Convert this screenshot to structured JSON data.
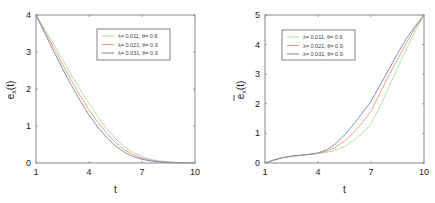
{
  "chart_data": [
    {
      "type": "line",
      "title": "",
      "xlabel": "t",
      "ylabel": "e_x(t)",
      "ylabel_main": "e",
      "ylabel_sub": "x",
      "ylabel_tail": "(t)",
      "ylabel_bar": false,
      "xlim": [
        1,
        10
      ],
      "ylim": [
        0,
        4
      ],
      "xticks": [
        1,
        4,
        7,
        10
      ],
      "yticks": [
        0,
        1,
        2,
        3,
        4
      ],
      "grid": false,
      "legend_position": "top-right",
      "x": [
        1,
        1.5,
        2,
        2.5,
        3,
        3.5,
        4,
        4.5,
        5,
        5.5,
        6,
        6.5,
        7,
        7.5,
        8,
        8.5,
        9,
        9.5,
        10
      ],
      "series": [
        {
          "name": "λ= 0.011,  θ= 0.9",
          "color": "#a8dca0",
          "values": [
            4.0,
            3.62,
            3.22,
            2.8,
            2.38,
            1.98,
            1.6,
            1.25,
            0.93,
            0.66,
            0.44,
            0.28,
            0.17,
            0.1,
            0.055,
            0.03,
            0.015,
            0.006,
            0.0
          ]
        },
        {
          "name": "λ= 0.021,  θ= 0.9",
          "color": "#e89a7a",
          "values": [
            4.0,
            3.56,
            3.12,
            2.67,
            2.23,
            1.82,
            1.44,
            1.1,
            0.8,
            0.55,
            0.36,
            0.22,
            0.13,
            0.075,
            0.04,
            0.02,
            0.01,
            0.004,
            0.0
          ]
        },
        {
          "name": "λ= 0.031,  θ= 0.9",
          "color": "#7d7fae",
          "values": [
            4.0,
            3.5,
            3.02,
            2.55,
            2.1,
            1.68,
            1.3,
            0.97,
            0.69,
            0.46,
            0.29,
            0.17,
            0.1,
            0.055,
            0.03,
            0.015,
            0.007,
            0.003,
            0.0
          ]
        }
      ]
    },
    {
      "type": "line",
      "title": "",
      "xlabel": "t",
      "ylabel": "ē_x(t)",
      "ylabel_main": "e",
      "ylabel_sub": "x",
      "ylabel_tail": "(t)",
      "ylabel_bar": true,
      "xlim": [
        1,
        10
      ],
      "ylim": [
        0,
        5
      ],
      "xticks": [
        1,
        4,
        7,
        10
      ],
      "yticks": [
        0,
        1,
        2,
        3,
        4,
        5
      ],
      "grid": false,
      "legend_position": "top-left",
      "x": [
        1,
        1.5,
        2,
        2.5,
        3,
        3.5,
        4,
        4.5,
        5,
        5.5,
        6,
        6.5,
        7,
        7.5,
        8,
        8.5,
        9,
        9.5,
        10
      ],
      "series": [
        {
          "name": "λ= 0.011,  θ= 0.9",
          "color": "#a8dca0",
          "values": [
            0.0,
            0.1,
            0.18,
            0.23,
            0.26,
            0.29,
            0.32,
            0.36,
            0.43,
            0.56,
            0.75,
            1.0,
            1.32,
            1.9,
            2.55,
            3.2,
            3.85,
            4.45,
            5.0
          ]
        },
        {
          "name": "λ= 0.021,  θ= 0.9",
          "color": "#e89a7a",
          "values": [
            0.0,
            0.1,
            0.18,
            0.23,
            0.26,
            0.29,
            0.33,
            0.4,
            0.53,
            0.74,
            1.02,
            1.36,
            1.75,
            2.35,
            2.95,
            3.5,
            4.05,
            4.55,
            5.0
          ]
        },
        {
          "name": "λ= 0.031,  θ= 0.9",
          "color": "#7d7fae",
          "values": [
            0.0,
            0.1,
            0.18,
            0.23,
            0.26,
            0.29,
            0.34,
            0.45,
            0.65,
            0.95,
            1.3,
            1.68,
            2.08,
            2.62,
            3.15,
            3.7,
            4.2,
            4.62,
            5.0
          ]
        }
      ]
    }
  ]
}
